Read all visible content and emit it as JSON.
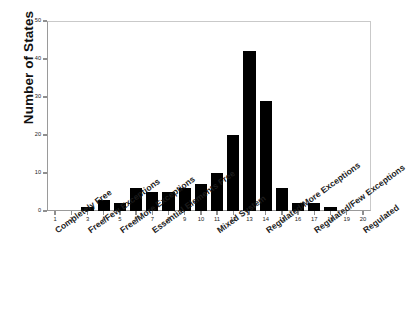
{
  "chart_data": {
    "type": "bar",
    "title": "",
    "xlabel": "",
    "ylabel": "Number of States",
    "ylim": [
      0,
      50
    ],
    "xlim": [
      0.5,
      20.5
    ],
    "grid": false,
    "legend": null,
    "bar_color": "#000000",
    "axis_color": "#8f8f8f",
    "categories": [
      "1",
      "2",
      "3",
      "4",
      "5",
      "6",
      "7",
      "8",
      "9",
      "10",
      "11",
      "12",
      "13",
      "14",
      "15",
      "16",
      "17",
      "18",
      "19",
      "20"
    ],
    "values": [
      0,
      0,
      1,
      3,
      2,
      6,
      5,
      5,
      6,
      7,
      10,
      20,
      42,
      29,
      6,
      2,
      2,
      1,
      0,
      0
    ],
    "y_ticks": [
      0,
      10,
      20,
      30,
      40,
      50
    ],
    "x_ticks": [
      "1",
      "2",
      "3",
      "4",
      "5",
      "6",
      "7",
      "8",
      "9",
      "10",
      "11",
      "12",
      "13",
      "14",
      "15",
      "16",
      "17",
      "18",
      "19",
      "20"
    ],
    "category_labels": [
      {
        "text": "Completely Free",
        "tick": 1
      },
      {
        "text": "Free/Few Exceptions",
        "tick": 3
      },
      {
        "text": "Free/More Exceptions",
        "tick": 5
      },
      {
        "text": "Essential Elements Free",
        "tick": 7
      },
      {
        "text": "Mixed System",
        "tick": 11
      },
      {
        "text": "Regulated/More Exceptions",
        "tick": 14
      },
      {
        "text": "Regulated/Few Exceptions",
        "tick": 17
      },
      {
        "text": "Regulated",
        "tick": 20
      }
    ]
  }
}
